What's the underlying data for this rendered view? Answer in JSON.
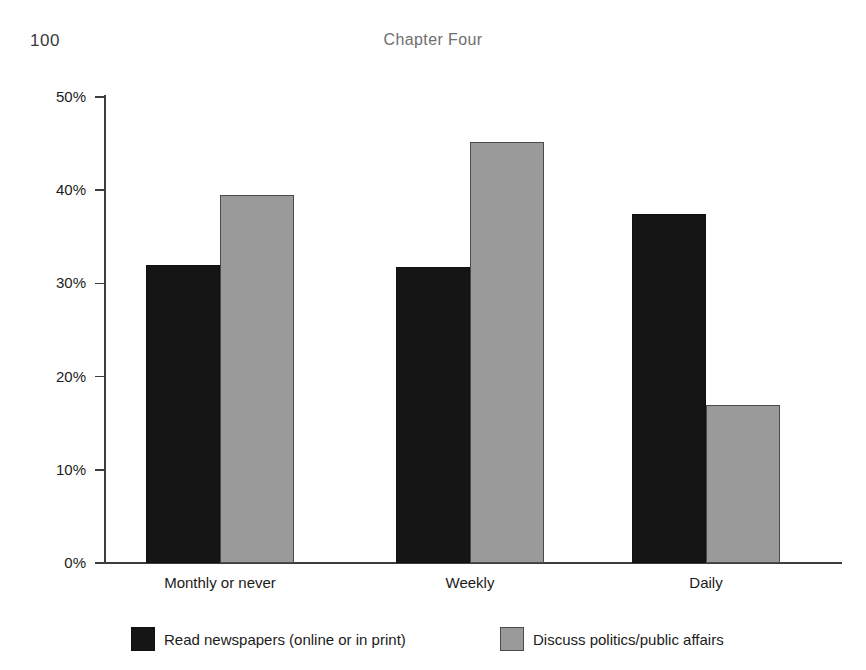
{
  "page": {
    "number": "100",
    "running_head": "Chapter Four"
  },
  "chart_data": {
    "type": "bar",
    "title": "",
    "xlabel": "",
    "ylabel": "",
    "categories": [
      "Monthly or never",
      "Weekly",
      "Daily"
    ],
    "series": [
      {
        "name": "Read newspapers (online or in print)",
        "color": "#151515",
        "values": [
          32.0,
          31.8,
          37.5
        ]
      },
      {
        "name": "Discuss politics/public affairs",
        "color": "#9a9a9a",
        "values": [
          39.5,
          45.2,
          17.0
        ]
      }
    ],
    "ylim": [
      0,
      50
    ],
    "yticks": [
      0,
      10,
      20,
      30,
      40,
      50
    ],
    "ytick_labels": [
      "0%",
      "10%",
      "20%",
      "30%",
      "40%",
      "50%"
    ],
    "grid": false,
    "legend_position": "bottom"
  }
}
